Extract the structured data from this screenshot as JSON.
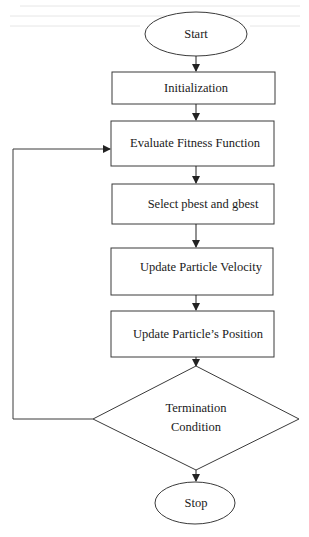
{
  "diagram": {
    "type": "flowchart",
    "colors": {
      "stroke": "#3a3a3a",
      "text": "#1a1a1a",
      "background": "#ffffff"
    },
    "nodes": [
      {
        "id": "start",
        "shape": "ellipse",
        "label": "Start"
      },
      {
        "id": "init",
        "shape": "rect",
        "label": "Initialization"
      },
      {
        "id": "eval",
        "shape": "rect",
        "label": "Evaluate Fitness Function"
      },
      {
        "id": "select",
        "shape": "rect",
        "label": "Select pbest and gbest"
      },
      {
        "id": "velocity",
        "shape": "rect",
        "label": "Update Particle Velocity"
      },
      {
        "id": "position",
        "shape": "rect",
        "label": "Update Particle’s Position"
      },
      {
        "id": "term",
        "shape": "diamond",
        "label_lines": [
          "Termination",
          "Condition"
        ]
      },
      {
        "id": "stop",
        "shape": "ellipse",
        "label": "Stop"
      }
    ],
    "edges": [
      {
        "from": "start",
        "to": "init"
      },
      {
        "from": "init",
        "to": "eval"
      },
      {
        "from": "eval",
        "to": "select"
      },
      {
        "from": "select",
        "to": "velocity"
      },
      {
        "from": "velocity",
        "to": "position"
      },
      {
        "from": "position",
        "to": "term"
      },
      {
        "from": "term",
        "to": "stop"
      },
      {
        "from": "term",
        "to": "eval",
        "kind": "loop-back"
      }
    ]
  }
}
